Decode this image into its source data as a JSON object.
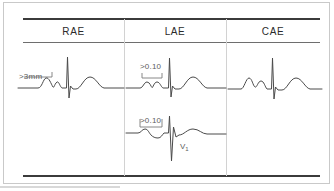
{
  "figure": {
    "type": "ecg-atrial-enlargement-comparison",
    "columns": [
      {
        "id": "rae",
        "header": "RAE",
        "name": "right-atrial-enlargement",
        "traces": [
          {
            "id": "rae-trace",
            "lead_label": "",
            "annotation": ">3mm",
            "annotation_meaning": "P wave amplitude greater than 3 mm",
            "p_wave": "tall-peaked"
          }
        ]
      },
      {
        "id": "lae",
        "header": "LAE",
        "name": "left-atrial-enlargement",
        "traces": [
          {
            "id": "lae-trace-top",
            "lead_label": "",
            "annotation": ">0.10",
            "annotation_meaning": "P wave duration greater than 0.10 seconds",
            "p_wave": "notched-bifid"
          },
          {
            "id": "lae-trace-v1",
            "lead_label": "V1",
            "lead_label_base": "V",
            "lead_label_sub": "1",
            "annotation": ">0.10",
            "annotation_meaning": "Terminal negative P wave deflection in V1 greater than 0.10 seconds",
            "p_wave": "biphasic-negative-terminal"
          }
        ]
      },
      {
        "id": "cae",
        "header": "CAE",
        "name": "combined-atrial-enlargement",
        "traces": [
          {
            "id": "cae-trace",
            "lead_label": "",
            "annotation": "",
            "p_wave": "tall-and-wide"
          }
        ]
      }
    ],
    "colors": {
      "background": "#ffffff",
      "trace_stroke": "#4a4a4a",
      "annotation_text": "#5d5d5d",
      "header_text": "#2b2b2b",
      "rule_dark": "#3b3b3b",
      "rule_light": "#6e6e6e",
      "divider": "#d2d2d2",
      "frame": "#c9c9c9"
    }
  }
}
